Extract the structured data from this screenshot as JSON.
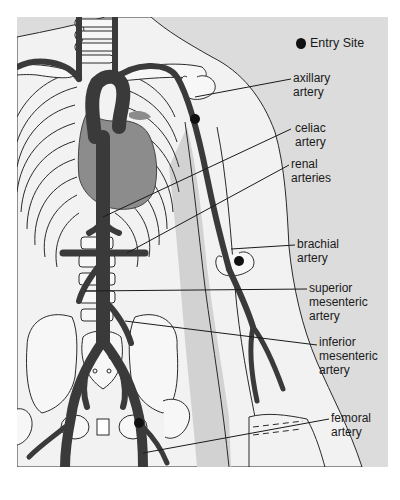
{
  "legend": {
    "marker": "filled-circle",
    "label": "Entry Site"
  },
  "labels": [
    {
      "id": "axillary",
      "line1": "axillary",
      "line2": "artery"
    },
    {
      "id": "celiac",
      "line1": "celiac",
      "line2": "artery"
    },
    {
      "id": "renal",
      "line1": "renal",
      "line2": "arteries"
    },
    {
      "id": "brachial",
      "line1": "brachial",
      "line2": "artery"
    },
    {
      "id": "sma",
      "line1": "superior",
      "line2": "mesenteric",
      "line3": "artery"
    },
    {
      "id": "ima",
      "line1": "inferior",
      "line2": "mesenteric",
      "line3": "artery"
    },
    {
      "id": "femoral",
      "line1": "femoral",
      "line2": "artery"
    }
  ],
  "entry_sites": [
    "axillary artery",
    "brachial artery",
    "femoral artery"
  ],
  "colors": {
    "background": "#dcdcdc",
    "skin": "#f2f2f2",
    "bone": "#f7f7f7",
    "vessel": "#3a3a3a",
    "heart": "#8c8c8c",
    "outline": "#2a2a2a",
    "arm_shade": "#cfcfcf"
  }
}
